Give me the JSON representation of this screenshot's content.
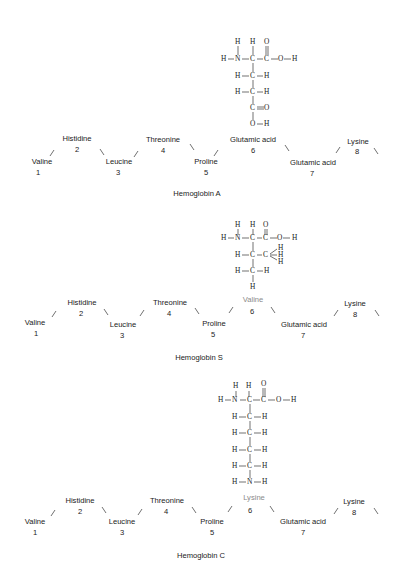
{
  "panels": [
    {
      "id": "hemoglobin-a",
      "caption": "Hemoglobin A",
      "residues": [
        {
          "name": "Valine",
          "position": "1"
        },
        {
          "name": "Histidine",
          "position": "2"
        },
        {
          "name": "Leucine",
          "position": "3"
        },
        {
          "name": "Threonine",
          "position": "4"
        },
        {
          "name": "Proline",
          "position": "5"
        },
        {
          "name": "Glutamic acid",
          "position": "6"
        },
        {
          "name": "Glutamic acid",
          "position": "7"
        },
        {
          "name": "Lysine",
          "position": "8"
        }
      ],
      "highlight": {
        "position": "6",
        "name": "Glutamic acid",
        "side_chain": [
          "H-C-H",
          "H-C-H",
          "C=O",
          "O-H"
        ]
      }
    },
    {
      "id": "hemoglobin-s",
      "caption": "Hemoglobin S",
      "residues": [
        {
          "name": "Valine",
          "position": "1"
        },
        {
          "name": "Histidine",
          "position": "2"
        },
        {
          "name": "Leucine",
          "position": "3"
        },
        {
          "name": "Threonine",
          "position": "4"
        },
        {
          "name": "Proline",
          "position": "5"
        },
        {
          "name": "Valine",
          "position": "6"
        },
        {
          "name": "Glutamic acid",
          "position": "7"
        },
        {
          "name": "Lysine",
          "position": "8"
        }
      ],
      "highlight": {
        "position": "6",
        "name": "Valine",
        "side_chain": [
          "H-C-CH3",
          "H-C-H",
          "H"
        ]
      }
    },
    {
      "id": "hemoglobin-c",
      "caption": "Hemoglobin C",
      "residues": [
        {
          "name": "Valine",
          "position": "1"
        },
        {
          "name": "Histidine",
          "position": "2"
        },
        {
          "name": "Leucine",
          "position": "3"
        },
        {
          "name": "Threonine",
          "position": "4"
        },
        {
          "name": "Proline",
          "position": "5"
        },
        {
          "name": "Lysine",
          "position": "6"
        },
        {
          "name": "Glutamic acid",
          "position": "7"
        },
        {
          "name": "Lysine",
          "position": "8"
        }
      ],
      "highlight": {
        "position": "6",
        "name": "Lysine",
        "side_chain": [
          "H-C-H",
          "H-C-H",
          "H-C-H",
          "H-C-H",
          "H-N-H"
        ]
      }
    }
  ],
  "atoms": {
    "H": "H",
    "N": "N",
    "C": "C",
    "O": "O"
  },
  "colors": {
    "text": "#1a1a1a",
    "highlight_label": "#8a8a8a",
    "background": "#ffffff"
  }
}
